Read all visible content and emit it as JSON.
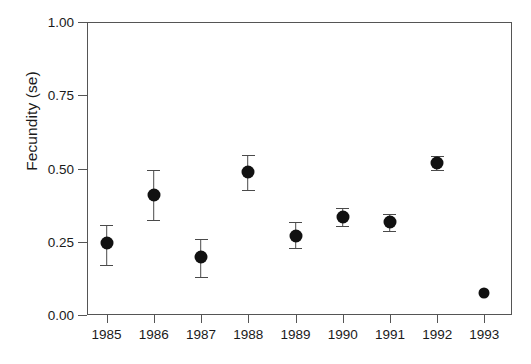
{
  "chart_data": {
    "type": "scatter",
    "title": "",
    "xlabel": "",
    "ylabel": "Fecundity (se)",
    "grid": false,
    "legend": null,
    "error_bars": "se",
    "xlim": [
      1984.5,
      1993.5
    ],
    "ylim": [
      0.0,
      1.0
    ],
    "ytick_labels": [
      "0.00",
      "0.25",
      "0.50",
      "0.75",
      "1.00"
    ],
    "ytick_values": [
      0.0,
      0.25,
      0.5,
      0.75,
      1.0
    ],
    "categories": [
      "1985",
      "1986",
      "1987",
      "1988",
      "1989",
      "1990",
      "1991",
      "1992",
      "1993"
    ],
    "values": [
      0.245,
      0.41,
      0.198,
      0.488,
      0.27,
      0.335,
      0.317,
      0.519,
      0.075
    ],
    "err_low": [
      0.171,
      0.325,
      0.13,
      0.427,
      0.229,
      0.304,
      0.287,
      0.495,
      null
    ],
    "err_high": [
      0.307,
      0.495,
      0.26,
      0.546,
      0.317,
      0.365,
      0.345,
      0.543,
      null
    ],
    "points": [
      {
        "x": "1985",
        "y": 0.245,
        "low": 0.171,
        "high": 0.307
      },
      {
        "x": "1986",
        "y": 0.41,
        "low": 0.325,
        "high": 0.495
      },
      {
        "x": "1987",
        "y": 0.198,
        "low": 0.13,
        "high": 0.26
      },
      {
        "x": "1988",
        "y": 0.488,
        "low": 0.427,
        "high": 0.546
      },
      {
        "x": "1989",
        "y": 0.27,
        "low": 0.229,
        "high": 0.317
      },
      {
        "x": "1990",
        "y": 0.335,
        "low": 0.304,
        "high": 0.365
      },
      {
        "x": "1991",
        "y": 0.317,
        "low": 0.287,
        "high": 0.345
      },
      {
        "x": "1992",
        "y": 0.519,
        "low": 0.495,
        "high": 0.543
      },
      {
        "x": "1993",
        "y": 0.075,
        "low": null,
        "high": null
      }
    ],
    "marker_color": "#111111",
    "errorbar_color": "#4a4a4a",
    "axis_color": "#555555",
    "background_color": "#ffffff"
  }
}
